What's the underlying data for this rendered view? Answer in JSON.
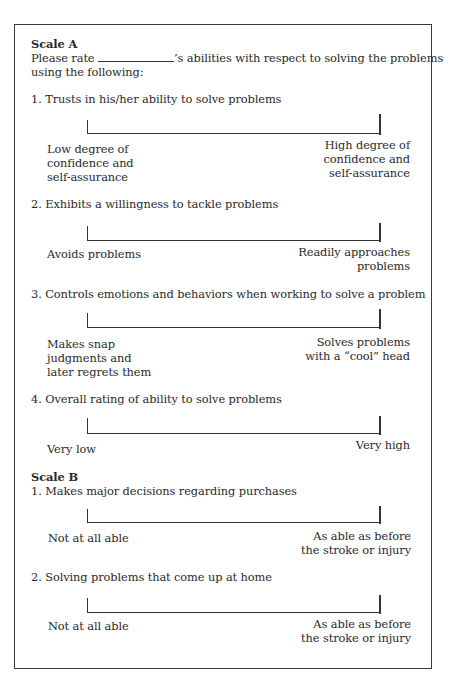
{
  "scale_a": {
    "heading": "Scale A",
    "instruction_prefix": "Please rate",
    "instruction_suffix": "’s abilities with respect to solving the problems",
    "instruction_line2": "using the following:",
    "items": [
      {
        "number": "1.",
        "text": "Trusts in his/her ability to solve problems",
        "left_anchor": [
          "Low degree of",
          "confidence and",
          "self-assurance"
        ],
        "right_anchor": [
          "High degree of",
          "confidence and",
          "self-assurance"
        ]
      },
      {
        "number": "2.",
        "text": "Exhibits a willingness to tackle problems",
        "left_anchor": [
          "Avoids problems"
        ],
        "right_anchor": [
          "Readily approaches",
          "problems"
        ]
      },
      {
        "number": "3.",
        "text": "Controls emotions and behaviors when working to solve a problem",
        "left_anchor": [
          "Makes snap",
          "judgments and",
          "later regrets them"
        ],
        "right_anchor": [
          "Solves problems",
          "with a “cool” head"
        ]
      },
      {
        "number": "4.",
        "text": "Overall rating of ability to solve problems",
        "left_anchor": [
          "Very low"
        ],
        "right_anchor": [
          "Very high"
        ]
      }
    ]
  },
  "scale_b": {
    "heading": "Scale B",
    "items": [
      {
        "number": "1.",
        "text": "Makes major decisions regarding purchases",
        "left_anchor": [
          "Not at all able"
        ],
        "right_anchor": [
          "As able as before",
          "the stroke or injury"
        ]
      },
      {
        "number": "2.",
        "text": "Solving problems that come up at home",
        "left_anchor": [
          "Not at all able"
        ],
        "right_anchor": [
          "As able as before",
          "the stroke or injury"
        ]
      }
    ]
  }
}
